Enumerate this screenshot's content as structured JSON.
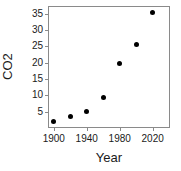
{
  "chart_data": {
    "type": "scatter",
    "title": "",
    "xlabel": "Year",
    "ylabel": "CO2",
    "xlim": [
      1893,
      2041
    ],
    "ylim": [
      0.0,
      37.3
    ],
    "grid": false,
    "legend": null,
    "x_ticks": [
      1900,
      1940,
      1980,
      2020
    ],
    "x_tick_labels": [
      "1900",
      "1940",
      "1980",
      "2020"
    ],
    "y_ticks": [
      5,
      10,
      15,
      20,
      25,
      30,
      35
    ],
    "y_tick_labels": [
      "5",
      "10",
      "15",
      "20",
      "25",
      "30",
      "35"
    ],
    "x": [
      1900,
      1920,
      1940,
      1960,
      1980,
      2000,
      2020
    ],
    "values": [
      1.9,
      3.5,
      5.0,
      9.4,
      19.6,
      25.4,
      35.4
    ],
    "points": [
      {
        "x": 1900,
        "y": 1.9
      },
      {
        "x": 1920,
        "y": 3.5
      },
      {
        "x": 1940,
        "y": 5.0
      },
      {
        "x": 1960,
        "y": 9.4
      },
      {
        "x": 1980,
        "y": 19.6
      },
      {
        "x": 2000,
        "y": 25.4
      },
      {
        "x": 2020,
        "y": 35.4
      }
    ],
    "marker": "filled-circle",
    "marker_color": "#000000",
    "axis_color": "#8a8a8a",
    "background_color": "#ffffff"
  }
}
